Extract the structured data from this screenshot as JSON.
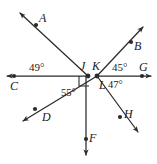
{
  "figure": {
    "kind": "geometry-diagram",
    "width": 157,
    "height": 164,
    "background_color": "#ffffff",
    "stroke_color": "#2b2b2b",
    "text_color": "#1a1a1a"
  },
  "points": [
    {
      "id": "C",
      "label": "C",
      "x": 14,
      "y": 76,
      "label_x": 12,
      "label_y": 80
    },
    {
      "id": "J",
      "label": "J",
      "x": 88,
      "y": 76,
      "label_x": 81,
      "label_y": 59
    },
    {
      "id": "K",
      "label": "K",
      "x": 97,
      "y": 76,
      "label_x": 94,
      "label_y": 59
    },
    {
      "id": "G",
      "label": "G",
      "x": 142,
      "y": 76,
      "label_x": 140,
      "label_y": 62
    },
    {
      "id": "A",
      "label": "A",
      "x": 36,
      "y": 25,
      "label_x": 39,
      "label_y": 17
    },
    {
      "id": "B",
      "label": "B",
      "x": 131,
      "y": 42,
      "label_x": 134,
      "label_y": 45
    },
    {
      "id": "D",
      "label": "D",
      "x": 35,
      "y": 109,
      "label_x": 41,
      "label_y": 113
    },
    {
      "id": "F",
      "label": "F",
      "x": 84,
      "y": 139,
      "label_x": 88,
      "label_y": 133
    },
    {
      "id": "H",
      "label": "H",
      "x": 120,
      "y": 117,
      "label_x": 124,
      "label_y": 110
    },
    {
      "id": "L",
      "label": "L",
      "x": 104,
      "y": 84,
      "label_x": 100,
      "label_y": 82
    }
  ],
  "angles": [
    {
      "id": "angle-49",
      "value": "49°",
      "at": "J",
      "x": 30,
      "y": 63
    },
    {
      "id": "angle-45",
      "value": "45°",
      "at": "K",
      "x": 113,
      "y": 63
    },
    {
      "id": "angle-47",
      "value": "47°",
      "at": "K",
      "x": 110,
      "y": 82
    },
    {
      "id": "angle-55",
      "value": "55°",
      "at": "K",
      "x": 62,
      "y": 90
    }
  ],
  "markers": [
    {
      "id": "right-angle-square",
      "at": "K",
      "type": "right-angle"
    }
  ],
  "rays": [
    {
      "id": "ray-CG-left",
      "from": "J",
      "to": "C",
      "arrow": true
    },
    {
      "id": "ray-CG-right",
      "from": "K",
      "to": "G",
      "arrow": true
    },
    {
      "id": "ray-JA",
      "from": "J",
      "to": "A",
      "arrow": true
    },
    {
      "id": "ray-KB",
      "from": "K",
      "to": "B",
      "arrow": true
    },
    {
      "id": "ray-KD",
      "from": "K",
      "to": "D",
      "arrow": true
    },
    {
      "id": "ray-KF",
      "from": "K",
      "to": "F",
      "arrow": true
    },
    {
      "id": "ray-KH",
      "from": "K",
      "to": "H",
      "arrow": true
    }
  ]
}
